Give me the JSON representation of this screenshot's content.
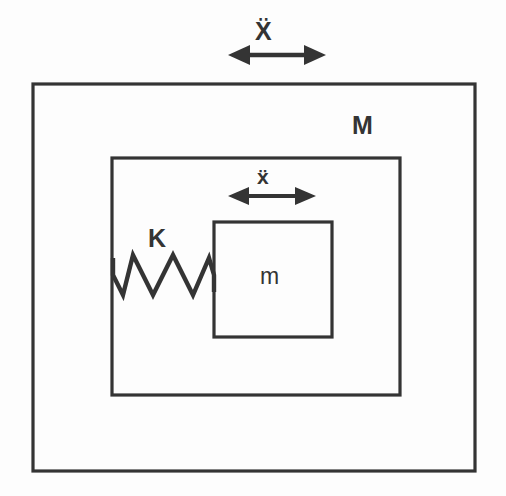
{
  "figure": {
    "kind": "mechanical-schematic",
    "background_color": "#fdfdfd",
    "line_color": "#343434"
  },
  "labels": {
    "outer_mass": "M",
    "inner_mass": "m",
    "spring": "K",
    "outer_acceleration": "Ẍ",
    "inner_acceleration": "ẍ"
  },
  "arrows": [
    {
      "name": "outer-acceleration-arrow",
      "label": "Ẍ",
      "direction": "double-horizontal",
      "x_start": 228,
      "x_end": 326,
      "y": 55
    },
    {
      "name": "inner-acceleration-arrow",
      "label": "ẍ",
      "direction": "double-horizontal",
      "x_start": 228,
      "x_end": 316,
      "y": 196
    }
  ],
  "shapes": {
    "outer_box": {
      "name": "outer-mass-box",
      "label": "M",
      "x": 33,
      "y": 84,
      "width": 442,
      "height": 387
    },
    "inner_box": {
      "name": "inner-frame-box",
      "x": 112,
      "y": 158,
      "width": 288,
      "height": 237
    },
    "mass_block": {
      "name": "inner-mass-block",
      "label": "m",
      "x": 214,
      "y": 222,
      "width": 118,
      "height": 115
    },
    "spring": {
      "name": "spring-element",
      "label": "K",
      "x_start": 113,
      "x_end": 214,
      "y_top": 255,
      "y_bottom": 295,
      "coils": 5
    }
  },
  "colors": {
    "stroke": "#343434",
    "background": "#fdfdfd",
    "text": "#343434"
  }
}
